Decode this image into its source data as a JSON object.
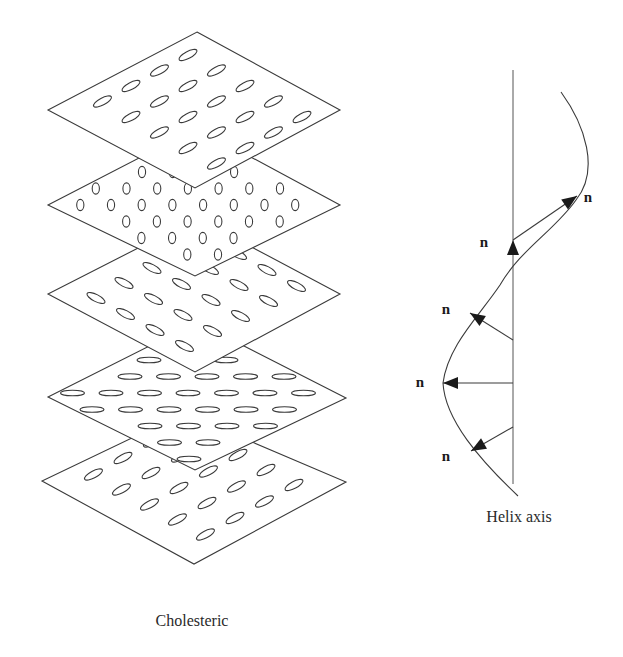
{
  "figure": {
    "caption_left": "Cholesteric",
    "caption_right": "Helix axis",
    "director_label": "n",
    "colors": {
      "line": "#3a3a3a",
      "arrow_fill": "#1a1a1a",
      "text": "#2a2a2a",
      "background": "#ffffff"
    }
  },
  "cholesteric_stack": {
    "planes": [
      {
        "name": "plane-5-bottom",
        "orientation": "tilted-up-right",
        "diamond": [
          [
            184,
            413
          ],
          [
            346,
            482
          ],
          [
            194,
            564
          ],
          [
            42,
            481
          ]
        ],
        "ellipse": {
          "rx": 10,
          "ry": 3.5,
          "angle": -28
        },
        "lattice": {
          "origin": [
            123,
            458
          ],
          "a": [
            28,
            15
          ],
          "b": [
            -29.5,
            16.5
          ],
          "i": [
            -2,
            6
          ],
          "j": [
            -2,
            4
          ]
        }
      },
      {
        "name": "plane-4",
        "orientation": "horizontal",
        "diamond": [
          [
            197,
            322
          ],
          [
            346,
            398
          ],
          [
            195,
            470
          ],
          [
            48,
            397
          ]
        ],
        "ellipse": {
          "rx": 12,
          "ry": 2.8,
          "angle": 0
        },
        "lattice": {
          "origin": [
            149,
            360
          ],
          "a": [
            38.5,
            0
          ],
          "b": [
            -19,
            16.5
          ],
          "i": [
            -2,
            8
          ],
          "j": [
            -1,
            7
          ]
        }
      },
      {
        "name": "plane-3",
        "orientation": "tilted-down-right",
        "diamond": [
          [
            197,
            218
          ],
          [
            340,
            294
          ],
          [
            195,
            372
          ],
          [
            48,
            294
          ]
        ],
        "ellipse": {
          "rx": 10,
          "ry": 3.5,
          "angle": 27
        },
        "lattice": {
          "origin": [
            152,
            268
          ],
          "a": [
            29.5,
            16
          ],
          "b": [
            -28,
            15
          ],
          "i": [
            -2,
            6
          ],
          "j": [
            -4,
            4
          ]
        }
      },
      {
        "name": "plane-2",
        "orientation": "vertical",
        "diamond": [
          [
            197,
            128
          ],
          [
            340,
            205
          ],
          [
            195,
            276
          ],
          [
            48,
            205
          ]
        ],
        "ellipse": {
          "rx": 3.6,
          "ry": 5.6,
          "angle": 0
        },
        "lattice": {
          "origin": [
            142,
            172
          ],
          "a": [
            30.7,
            0
          ],
          "b": [
            -15.5,
            16.5
          ],
          "i": [
            -3,
            9
          ],
          "j": [
            -2,
            7
          ]
        }
      },
      {
        "name": "plane-1-top",
        "orientation": "tilted-up-right",
        "diamond": [
          [
            197,
            32
          ],
          [
            340,
            110
          ],
          [
            195,
            188
          ],
          [
            48,
            110
          ]
        ],
        "ellipse": {
          "rx": 10,
          "ry": 3.5,
          "angle": -28
        },
        "lattice": {
          "origin": [
            188,
            55
          ],
          "a": [
            28.5,
            15.5
          ],
          "b": [
            -28.5,
            15.5
          ],
          "i": [
            0,
            4
          ],
          "j": [
            0,
            4
          ]
        }
      }
    ]
  },
  "helix": {
    "axis": {
      "x": 513,
      "y_top": 70,
      "y_bottom": 484
    },
    "curve_path": "M561,92 C585,125 600,170 576,200 C555,230 520,250 500,285 C480,315 448,345 443,383 C445,420 480,460 518,496",
    "directors": [
      {
        "from": [
          513,
          240
        ],
        "to": [
          577,
          196
        ],
        "label_pos": [
          588,
          202
        ]
      },
      {
        "from": [
          513,
          272
        ],
        "to": [
          513,
          240
        ],
        "label_pos": [
          484,
          247
        ],
        "head_only": true
      },
      {
        "from": [
          513,
          340
        ],
        "to": [
          470,
          313
        ],
        "label_pos": [
          446,
          314
        ]
      },
      {
        "from": [
          513,
          383
        ],
        "to": [
          443,
          383
        ],
        "label_pos": [
          420,
          387
        ]
      },
      {
        "from": [
          513,
          427
        ],
        "to": [
          471,
          451
        ],
        "label_pos": [
          446,
          461
        ]
      }
    ],
    "caption_pos": [
      519,
      522
    ]
  },
  "caption_left_pos": [
    192,
    626
  ]
}
